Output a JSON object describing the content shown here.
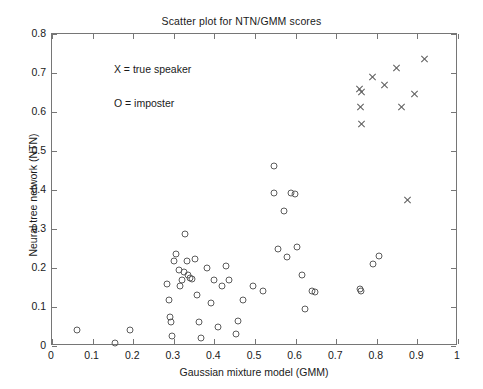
{
  "chart_data": {
    "type": "scatter",
    "title": "Scatter plot for NTN/GMM scores",
    "xlabel": "Gaussian mixture model (GMM)",
    "ylabel": "Neural tree network (NTN)",
    "xlim": [
      0,
      1
    ],
    "ylim": [
      0,
      0.8
    ],
    "xticks": [
      "0",
      "0.1",
      "0.2",
      "0.3",
      "0.4",
      "0.5",
      "0.6",
      "0.7",
      "0.8",
      "0.9",
      "1"
    ],
    "xtick_values": [
      0,
      0.1,
      0.2,
      0.3,
      0.4,
      0.5,
      0.6,
      0.7,
      0.8,
      0.9,
      1
    ],
    "yticks": [
      "0",
      "0.1",
      "0.2",
      "0.3",
      "0.4",
      "0.5",
      "0.6",
      "0.7",
      "0.8"
    ],
    "ytick_values": [
      0,
      0.1,
      0.2,
      0.3,
      0.4,
      0.5,
      0.6,
      0.7,
      0.8
    ],
    "grid": false,
    "legend_position": "inside-upper-left",
    "annotations": [
      {
        "text": "X = true speaker",
        "x": 0.155,
        "y": 0.705
      },
      {
        "text": "O = imposter",
        "x": 0.155,
        "y": 0.617
      }
    ],
    "series": [
      {
        "name": "true speaker",
        "marker": "x",
        "color": "#5c5c5c",
        "points": [
          [
            0.757,
            0.658
          ],
          [
            0.762,
            0.651
          ],
          [
            0.76,
            0.613
          ],
          [
            0.762,
            0.568
          ],
          [
            0.79,
            0.69
          ],
          [
            0.818,
            0.668
          ],
          [
            0.848,
            0.713
          ],
          [
            0.862,
            0.613
          ],
          [
            0.876,
            0.375
          ],
          [
            0.892,
            0.645
          ],
          [
            0.918,
            0.737
          ]
        ]
      },
      {
        "name": "imposter",
        "marker": "o",
        "color": "#5c5c5c",
        "points": [
          [
            0.062,
            0.04
          ],
          [
            0.155,
            0.008
          ],
          [
            0.193,
            0.04
          ],
          [
            0.283,
            0.16
          ],
          [
            0.288,
            0.118
          ],
          [
            0.29,
            0.075
          ],
          [
            0.293,
            0.062
          ],
          [
            0.296,
            0.025
          ],
          [
            0.3,
            0.218
          ],
          [
            0.306,
            0.237
          ],
          [
            0.312,
            0.196
          ],
          [
            0.316,
            0.155
          ],
          [
            0.32,
            0.168
          ],
          [
            0.325,
            0.19
          ],
          [
            0.328,
            0.288
          ],
          [
            0.333,
            0.218
          ],
          [
            0.336,
            0.182
          ],
          [
            0.34,
            0.175
          ],
          [
            0.345,
            0.172
          ],
          [
            0.352,
            0.222
          ],
          [
            0.358,
            0.132
          ],
          [
            0.363,
            0.062
          ],
          [
            0.368,
            0.02
          ],
          [
            0.382,
            0.2
          ],
          [
            0.392,
            0.11
          ],
          [
            0.4,
            0.17
          ],
          [
            0.408,
            0.048
          ],
          [
            0.418,
            0.155
          ],
          [
            0.428,
            0.205
          ],
          [
            0.436,
            0.168
          ],
          [
            0.452,
            0.03
          ],
          [
            0.458,
            0.065
          ],
          [
            0.47,
            0.118
          ],
          [
            0.496,
            0.155
          ],
          [
            0.52,
            0.142
          ],
          [
            0.546,
            0.462
          ],
          [
            0.548,
            0.392
          ],
          [
            0.556,
            0.248
          ],
          [
            0.572,
            0.345
          ],
          [
            0.578,
            0.228
          ],
          [
            0.588,
            0.392
          ],
          [
            0.598,
            0.39
          ],
          [
            0.604,
            0.253
          ],
          [
            0.616,
            0.182
          ],
          [
            0.622,
            0.096
          ],
          [
            0.64,
            0.14
          ],
          [
            0.648,
            0.138
          ],
          [
            0.758,
            0.145
          ],
          [
            0.762,
            0.142
          ],
          [
            0.79,
            0.21
          ],
          [
            0.805,
            0.232
          ]
        ]
      }
    ]
  }
}
